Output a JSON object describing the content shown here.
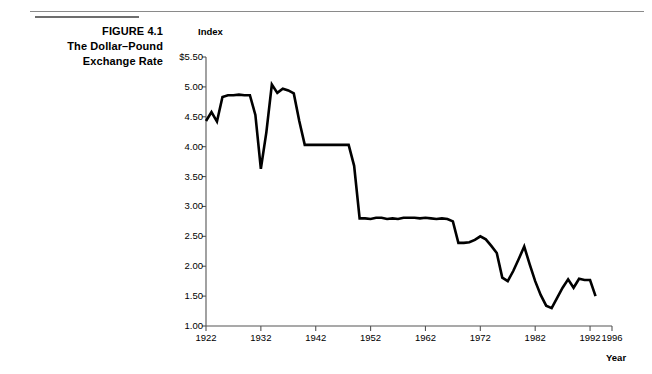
{
  "caption": {
    "line1": "FIGURE 4.1",
    "line2": "The Dollar–Pound",
    "line3": "Exchange Rate"
  },
  "chart_data": {
    "type": "line",
    "title": "The Dollar–Pound Exchange Rate",
    "figure_number": "FIGURE 4.1",
    "xlabel": "Year",
    "ylabel": "Index",
    "y_unit_prefix": "$",
    "xlim": [
      1922,
      1996
    ],
    "ylim": [
      1.0,
      5.5
    ],
    "grid": false,
    "legend": null,
    "x_ticks": [
      1922,
      1932,
      1942,
      1952,
      1962,
      1972,
      1982,
      1992,
      1996
    ],
    "x_tick_labels": [
      "1922",
      "1932",
      "1942",
      "1952",
      "1962",
      "1972",
      "1982",
      "1992",
      "1996"
    ],
    "y_ticks": [
      1.0,
      1.5,
      2.0,
      2.5,
      3.0,
      3.5,
      4.0,
      4.5,
      5.0,
      5.5
    ],
    "y_tick_labels": [
      "1.00",
      "1.50",
      "2.00",
      "2.50",
      "3.00",
      "3.50",
      "4.00",
      "4.50",
      "5.00",
      "$5.50"
    ],
    "series_name": "Dollar–Pound exchange rate",
    "line_color": "#000000",
    "line_width": 2.6,
    "x": [
      1922,
      1923,
      1924,
      1925,
      1926,
      1927,
      1928,
      1929,
      1930,
      1931,
      1932,
      1933,
      1934,
      1935,
      1936,
      1937,
      1938,
      1939,
      1940,
      1941,
      1942,
      1943,
      1944,
      1945,
      1946,
      1947,
      1948,
      1949,
      1950,
      1951,
      1952,
      1953,
      1954,
      1955,
      1956,
      1957,
      1958,
      1959,
      1960,
      1961,
      1962,
      1963,
      1964,
      1965,
      1966,
      1967,
      1968,
      1969,
      1970,
      1971,
      1972,
      1973,
      1974,
      1975,
      1976,
      1977,
      1978,
      1979,
      1980,
      1981,
      1982,
      1983,
      1984,
      1985,
      1986,
      1987,
      1988,
      1989,
      1990,
      1991,
      1992,
      1993
    ],
    "y": [
      4.43,
      4.58,
      4.42,
      4.83,
      4.86,
      4.86,
      4.87,
      4.86,
      4.86,
      4.53,
      3.63,
      4.24,
      5.04,
      4.9,
      4.97,
      4.94,
      4.89,
      4.43,
      4.03,
      4.03,
      4.03,
      4.03,
      4.03,
      4.03,
      4.03,
      4.03,
      4.03,
      3.68,
      2.8,
      2.8,
      2.79,
      2.81,
      2.81,
      2.79,
      2.8,
      2.79,
      2.81,
      2.81,
      2.81,
      2.8,
      2.81,
      2.8,
      2.79,
      2.8,
      2.79,
      2.75,
      2.39,
      2.39,
      2.4,
      2.44,
      2.5,
      2.45,
      2.34,
      2.22,
      1.81,
      1.75,
      1.92,
      2.12,
      2.33,
      2.03,
      1.75,
      1.52,
      1.34,
      1.3,
      1.47,
      1.64,
      1.78,
      1.64,
      1.79,
      1.77,
      1.77,
      1.5
    ]
  }
}
